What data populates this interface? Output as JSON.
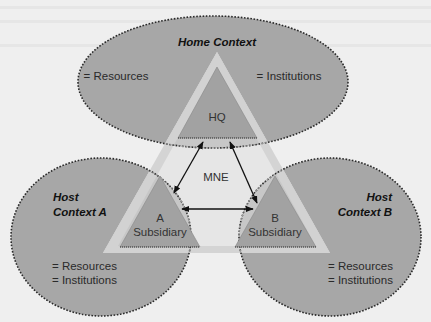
{
  "diagram": {
    "colors": {
      "page_background": "#efefef",
      "context_fill": "#a7a7a7",
      "context_border": "#2a2a2a",
      "mne_band": "#d3d3d3",
      "mne_interior": "#e6e6e6",
      "mne_overlap": "#c7c7c7",
      "unit_fill": "#a2a2a2",
      "arrow": "#111111"
    },
    "home_context": {
      "title": "Home Context",
      "left_item": "= Resources",
      "right_item": "= Institutions"
    },
    "host_context_a": {
      "title_line1": "Host",
      "title_line2": "Context A",
      "item1": "= Resources",
      "item2": "= Institutions"
    },
    "host_context_b": {
      "title_line1": "Host",
      "title_line2": "Context B",
      "item1": "= Resources",
      "item2": "= Institutions"
    },
    "mne": {
      "label": "MNE"
    },
    "hq": {
      "label": "HQ"
    },
    "subsidiary_a": {
      "line1": "A",
      "line2": "Subsidiary"
    },
    "subsidiary_b": {
      "line1": "B",
      "line2": "Subsidiary"
    },
    "arrows": [
      {
        "from": "HQ",
        "to": "A Subsidiary",
        "type": "bidirectional"
      },
      {
        "from": "HQ",
        "to": "B Subsidiary",
        "type": "bidirectional"
      },
      {
        "from": "A Subsidiary",
        "to": "B Subsidiary",
        "type": "bidirectional"
      }
    ]
  }
}
